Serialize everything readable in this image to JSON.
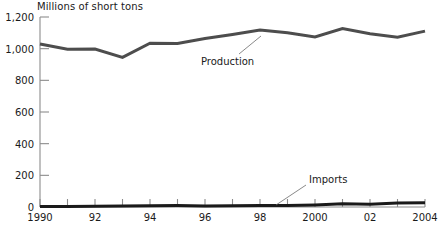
{
  "chart_data": {
    "type": "line",
    "title": "Millions of short tons",
    "xlabel": "",
    "ylabel": "Millions of short tons",
    "grid": false,
    "legend_position": "inline-annotation",
    "xlim": [
      1990,
      2004
    ],
    "ylim": [
      0,
      1200
    ],
    "x": [
      1990,
      1991,
      1992,
      1993,
      1994,
      1995,
      1996,
      1997,
      1998,
      1999,
      2000,
      2001,
      2002,
      2003,
      2004
    ],
    "ytick_labels": [
      "0",
      "200",
      "400",
      "600",
      "800",
      "1,000",
      "1,200"
    ],
    "ytick_values": [
      0,
      200,
      400,
      600,
      800,
      1000,
      1200
    ],
    "xtick_values": [
      1990,
      1991,
      1992,
      1993,
      1994,
      1995,
      1996,
      1997,
      1998,
      1999,
      2000,
      2001,
      2002,
      2003,
      2004
    ],
    "xtick_labels": [
      "1990",
      "",
      "92",
      "",
      "94",
      "",
      "96",
      "",
      "98",
      "",
      "2000",
      "",
      "02",
      "",
      "2004"
    ],
    "series": [
      {
        "name": "Production",
        "color": "#4d4d4d",
        "values": [
          1029,
          996,
          998,
          945,
          1034,
          1033,
          1064,
          1090,
          1118,
          1100,
          1074,
          1127,
          1094,
          1072,
          1111
        ]
      },
      {
        "name": "Imports",
        "color": "#1a1a1a",
        "values": [
          3,
          3,
          4,
          7,
          8,
          9,
          7,
          8,
          9,
          9,
          13,
          20,
          17,
          25,
          27
        ]
      }
    ],
    "annotations": [
      {
        "text": "Production",
        "target_year": 1998
      },
      {
        "text": "Imports",
        "target_year": 1999
      }
    ]
  },
  "axis": {
    "spine_color": "#8c8c8c",
    "tick_color": "#8c8c8c"
  }
}
